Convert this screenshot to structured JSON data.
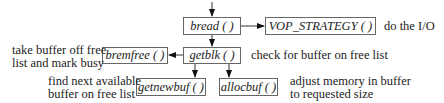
{
  "nodes": {
    "bread": "bread ( )",
    "vop_strategy": "VOP_STRATEGY ( )",
    "getblk": "getblk ( )",
    "bremfree": "bremfree ( )",
    "getnewbuf": "getnewbuf ( )",
    "allocbuf": "allocbuf ( )"
  },
  "annotations": {
    "vop_strategy": "do the I/O",
    "getblk": "check for buffer on free list",
    "bremfree_line1": "take buffer off free",
    "bremfree_line2": "list and mark busy",
    "getnewbuf_line1": "find next available",
    "getnewbuf_line2": "buffer on free list",
    "allocbuf_line1": "adjust memory in buffer",
    "allocbuf_line2": "to requested size"
  },
  "edges": [
    {
      "from": "caller",
      "to": "bread"
    },
    {
      "from": "bread",
      "to": "vop_strategy"
    },
    {
      "from": "bread",
      "to": "getblk"
    },
    {
      "from": "getblk",
      "to": "bremfree"
    },
    {
      "from": "getblk",
      "to": "getnewbuf"
    },
    {
      "from": "getblk",
      "to": "allocbuf"
    }
  ]
}
